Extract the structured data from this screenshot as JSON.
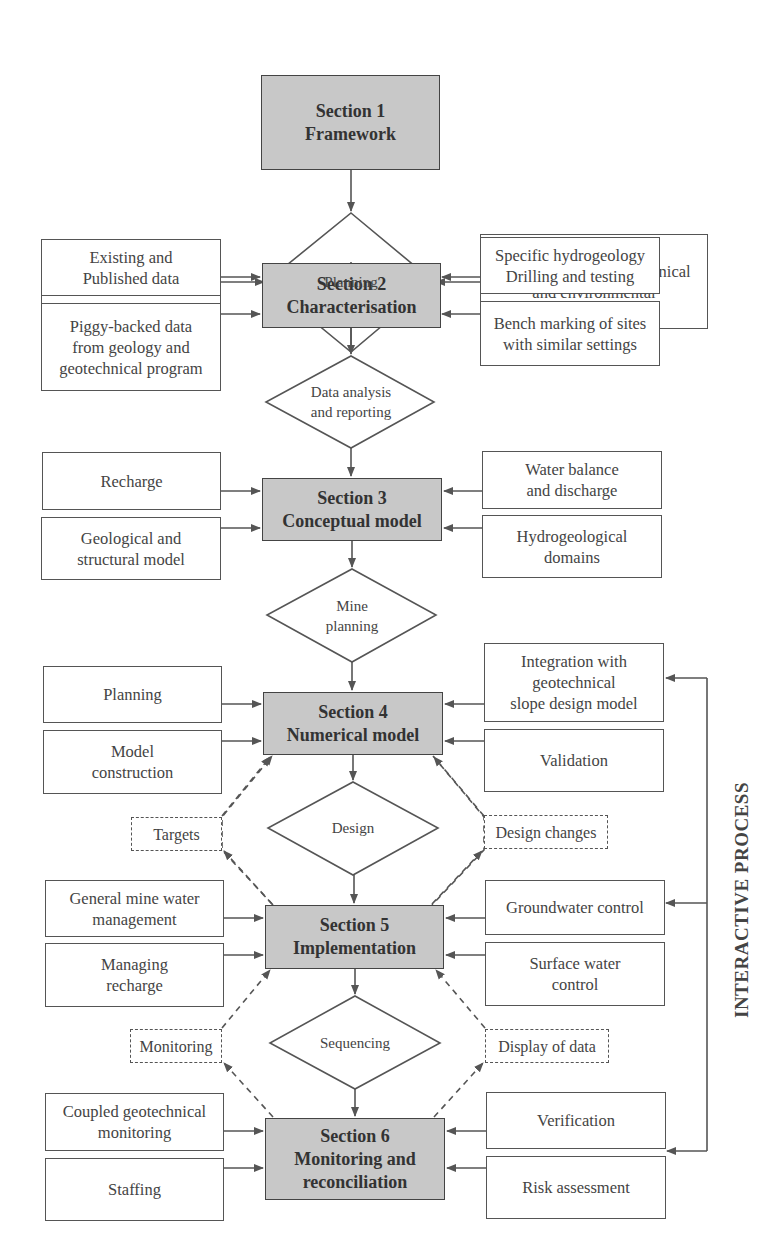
{
  "sections": [
    {
      "id": 1,
      "label": "Section 1\nFramework"
    },
    {
      "id": 2,
      "label": "Section 2\nCharacterisation"
    },
    {
      "id": 3,
      "label": "Section 3\nConceptual model"
    },
    {
      "id": 4,
      "label": "Section 4\nNumerical model"
    },
    {
      "id": 5,
      "label": "Section 5\nImplementation"
    },
    {
      "id": 6,
      "label": "Section 6\nMonitoring and\nreconciliation"
    }
  ],
  "decisions": [
    {
      "label": "Planning"
    },
    {
      "label": "Data analysis\nand reporting"
    },
    {
      "label": "Mine\nplanning"
    },
    {
      "label": "Design"
    },
    {
      "label": "Sequencing"
    }
  ],
  "inputs": {
    "s1_left": "Goals",
    "s1_right": "Integration with geotechnical\nand environmental",
    "s2_left_1": "Existing and\nPublished data",
    "s2_left_2": "Piggy-backed data\nfrom geology and\ngeotechnical  program",
    "s2_right_1": "Specific hydrogeology\nDrilling and testing",
    "s2_right_2": "Bench marking of sites\nwith similar settings",
    "s3_left_1": "Recharge",
    "s3_left_2": "Geological and\nstructural model",
    "s3_right_1": "Water balance\nand discharge",
    "s3_right_2": "Hydrogeological\ndomains",
    "s4_left_1": "Planning",
    "s4_left_2": "Model\nconstruction",
    "s4_right_1": "Integration with\ngeotechnical\nslope design model",
    "s4_right_2": "Validation",
    "s5_left_1": "General mine water\nmanagement",
    "s5_left_2": "Managing\nrecharge",
    "s5_right_1": "Groundwater control",
    "s5_right_2": "Surface water\ncontrol",
    "s6_left_1": "Coupled geotechnical\nmonitoring",
    "s6_left_2": "Staffing",
    "s6_right_1": "Verification",
    "s6_right_2": "Risk assessment"
  },
  "feedback": {
    "targets": "Targets",
    "design_changes": "Design changes",
    "monitoring": "Monitoring",
    "display_of_data": "Display of data"
  },
  "side_label": "INTERACTIVE PROCESS",
  "colors": {
    "section_fill": "#c8c8c8",
    "stroke": "#555555",
    "background": "#ffffff"
  }
}
